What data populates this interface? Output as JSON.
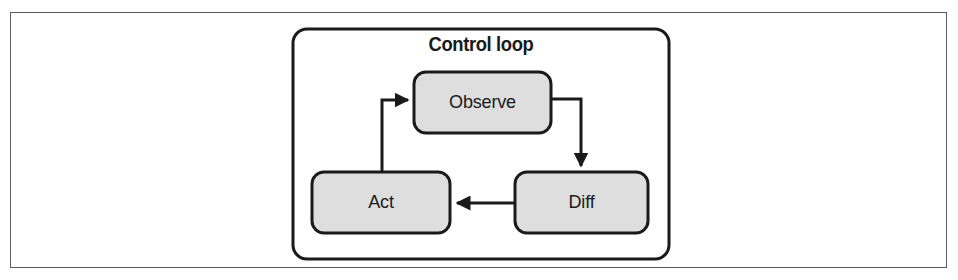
{
  "figure": {
    "background_color": "#ffffff",
    "frame_border_color": "#5a5a5a"
  },
  "diagram": {
    "type": "flowchart-cycle",
    "title": "Control loop",
    "group": {
      "name": "control-loop-group",
      "label": "Control loop",
      "fill": "#ffffff",
      "stroke": "#1a1a1a",
      "x": 293,
      "y": 29,
      "width": 376,
      "height": 230,
      "corner_radius": 14
    },
    "node_style": {
      "fill": "#dedede",
      "stroke": "#1a1a1a",
      "stroke_width": 3,
      "corner_radius": 12
    },
    "nodes": [
      {
        "id": "observe",
        "label": "Observe",
        "x": 414,
        "y": 72,
        "width": 137,
        "height": 61
      },
      {
        "id": "diff",
        "label": "Diff",
        "x": 515,
        "y": 172,
        "width": 133,
        "height": 61
      },
      {
        "id": "act",
        "label": "Act",
        "x": 312,
        "y": 172,
        "width": 138,
        "height": 61
      }
    ],
    "edges": [
      {
        "id": "observe-to-diff",
        "from": "observe",
        "to": "diff",
        "from_side": "right",
        "to_side": "top",
        "arrowhead": "down",
        "points": "551,99 581,99 581,167"
      },
      {
        "id": "diff-to-act",
        "from": "diff",
        "to": "act",
        "from_side": "left",
        "to_side": "right",
        "arrowhead": "left",
        "points": "515,203 456,203"
      },
      {
        "id": "act-to-observe",
        "from": "act",
        "to": "observe",
        "from_side": "top",
        "to_side": "left",
        "arrowhead": "right",
        "points": "382,172 382,100 408,100"
      }
    ],
    "edge_style": {
      "stroke": "#1a1a1a",
      "stroke_width": 3
    }
  }
}
